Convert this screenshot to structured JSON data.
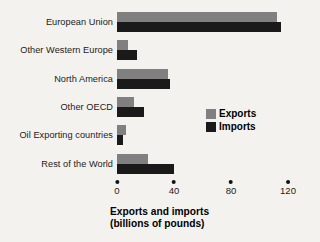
{
  "chart_data": {
    "type": "bar",
    "orientation": "horizontal",
    "title": "",
    "xlabel": "Exports and imports (billions of pounds)",
    "ylabel": "",
    "categories": [
      "European Union",
      "Other Western Europe",
      "North America",
      "Other OECD",
      "Oil Exporting countries",
      "Rest of the World"
    ],
    "series": [
      {
        "name": "Exports",
        "color": "#808080",
        "values": [
          112,
          8,
          36,
          12,
          6,
          22
        ]
      },
      {
        "name": "Imports",
        "color": "#1a1a1a",
        "values": [
          115,
          14,
          37,
          19,
          4,
          40
        ]
      }
    ],
    "xlim": [
      0,
      120
    ],
    "xticks": [
      0,
      40,
      80,
      120
    ],
    "xtick_labels": [
      "0",
      "40",
      "80",
      "120"
    ],
    "grid": false,
    "legend_position": "center-right",
    "tick_marker": "dot"
  },
  "axis": {
    "title_line1": "Exports and imports",
    "title_line2": "(billions of pounds)"
  },
  "legend": {
    "items": [
      {
        "label": "Exports",
        "color": "#808080"
      },
      {
        "label": "Imports",
        "color": "#1a1a1a"
      }
    ]
  },
  "colors": {
    "background": "#f4f2ee",
    "exports": "#808080",
    "imports": "#1a1a1a",
    "text": "#1b1b1b"
  }
}
